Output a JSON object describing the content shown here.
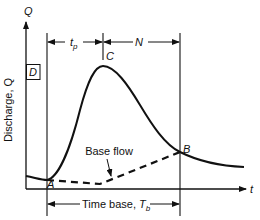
{
  "diagram": {
    "y_axis": {
      "symbol": "Q",
      "label": "Discharge, Q"
    },
    "x_axis": {
      "symbol": "t"
    },
    "box_label": "D",
    "points": {
      "start": "A",
      "peak": "C",
      "end": "B"
    },
    "dimensions": {
      "time_to_peak": {
        "symbol": "t",
        "subscript": "p"
      },
      "recession": "N",
      "time_base": {
        "text": "Time base, ",
        "symbol": "T",
        "subscript": "b"
      }
    },
    "base_flow_label": "Base flow",
    "colors": {
      "ink": "#111111",
      "background": "#ffffff"
    }
  }
}
